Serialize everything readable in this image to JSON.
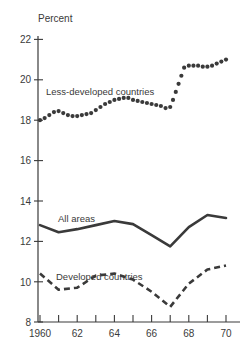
{
  "chart_data": {
    "type": "line",
    "title": "",
    "xlabel": "",
    "ylabel": "Percent",
    "ylim": [
      8,
      22
    ],
    "xlim": [
      1960,
      1970.6
    ],
    "grid": false,
    "legend_position": "inline-annotations",
    "y_ticks": [
      8,
      10,
      12,
      14,
      16,
      18,
      20,
      22
    ],
    "y_tick_labels": [
      "8",
      "10",
      "12",
      "14",
      "16",
      "18",
      "20",
      "22"
    ],
    "x_ticks": [
      1960,
      1961,
      1962,
      1963,
      1964,
      1965,
      1966,
      1967,
      1968,
      1969,
      1970
    ],
    "x_tick_labels": [
      "1960",
      "",
      "62",
      "",
      "64",
      "",
      "66",
      "",
      "68",
      "",
      "70"
    ],
    "x": [
      1960,
      1960.25,
      1960.5,
      1960.75,
      1961,
      1961.25,
      1961.5,
      1961.75,
      1962,
      1962.25,
      1962.5,
      1962.75,
      1963,
      1963.25,
      1963.5,
      1963.75,
      1964,
      1964.25,
      1964.5,
      1964.75,
      1965,
      1965.25,
      1965.5,
      1965.75,
      1966,
      1966.25,
      1966.5,
      1966.75,
      1967,
      1967.25,
      1967.5,
      1967.75,
      1968,
      1968.25,
      1968.5,
      1968.75,
      1969,
      1969.25,
      1969.5,
      1969.75,
      1970
    ],
    "series": [
      {
        "name": "Less-developed countries",
        "style": "dotted",
        "x": [
          1960,
          1960.25,
          1960.5,
          1960.75,
          1961,
          1961.25,
          1961.5,
          1961.75,
          1962,
          1962.25,
          1962.5,
          1962.75,
          1963,
          1963.25,
          1963.5,
          1963.75,
          1964,
          1964.25,
          1964.5,
          1964.75,
          1965,
          1965.25,
          1965.5,
          1965.75,
          1966,
          1966.25,
          1966.5,
          1966.75,
          1967,
          1967.15,
          1967.3,
          1967.45,
          1967.6,
          1967.75,
          1968,
          1968.25,
          1968.5,
          1968.75,
          1969,
          1969.25,
          1969.5,
          1969.75,
          1970
        ],
        "values": [
          18.0,
          18.1,
          18.25,
          18.4,
          18.45,
          18.35,
          18.25,
          18.2,
          18.2,
          18.25,
          18.3,
          18.35,
          18.5,
          18.65,
          18.8,
          18.9,
          19.0,
          19.05,
          19.1,
          19.1,
          19.0,
          18.95,
          18.9,
          18.85,
          18.8,
          18.75,
          18.7,
          18.6,
          18.65,
          19.0,
          19.4,
          19.8,
          20.2,
          20.6,
          20.7,
          20.7,
          20.7,
          20.65,
          20.65,
          20.7,
          20.8,
          20.9,
          21.0
        ]
      },
      {
        "name": "All areas",
        "style": "solid",
        "x": [
          1960,
          1961,
          1962,
          1963,
          1964,
          1965,
          1966,
          1967,
          1968,
          1969,
          1970
        ],
        "values": [
          12.8,
          12.45,
          12.6,
          12.8,
          13.0,
          12.85,
          12.3,
          11.75,
          12.7,
          13.3,
          13.15
        ]
      },
      {
        "name": "Developed countries",
        "style": "dashed",
        "x": [
          1960,
          1961,
          1962,
          1963,
          1964,
          1965,
          1966,
          1967,
          1968,
          1969,
          1970
        ],
        "values": [
          10.4,
          9.6,
          9.7,
          10.3,
          10.4,
          10.1,
          9.5,
          8.75,
          9.9,
          10.6,
          10.8
        ]
      }
    ],
    "annotations": [
      {
        "text": "Less-developed countries",
        "x": 1961.1,
        "y": 19.6
      },
      {
        "text": "All areas",
        "x": 1961.6,
        "y": 13.6
      },
      {
        "text": "Developed countries",
        "x": 1961.5,
        "y": 11.4
      }
    ],
    "colors": {
      "ink": "#3a3a3a",
      "background": "#ffffff"
    }
  },
  "labels": {
    "y_axis_title": "Percent",
    "y_22": "22",
    "y_20": "20",
    "y_18": "18",
    "y_16": "16",
    "y_14": "14",
    "y_12": "12",
    "y_10": "10",
    "y_8": "8",
    "x_1960": "1960",
    "x_62": "62",
    "x_64": "64",
    "x_66": "66",
    "x_68": "68",
    "x_70": "70",
    "series_less_developed": "Less-developed countries",
    "series_all_areas": "All areas",
    "series_developed": "Developed countries"
  }
}
